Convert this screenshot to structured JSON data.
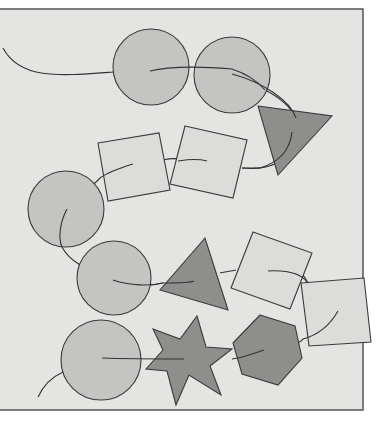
{
  "figure": {
    "colors": {
      "background": "#ffffff",
      "panel": "#e4e4e2",
      "circle_fill": "#c4c4c2",
      "square_fill": "#dcdcda",
      "dark_fill": "#8e8e8c",
      "stroke": "#3a3a3a"
    },
    "shapes": [
      {
        "type": "circle",
        "cx": 151,
        "cy": 67,
        "r": 38
      },
      {
        "type": "circle",
        "cx": 232,
        "cy": 75,
        "r": 38
      },
      {
        "type": "triangle",
        "points": "258,106 332,116 278,175"
      },
      {
        "type": "square",
        "points": "185,126 247,140 233,198 170,184"
      },
      {
        "type": "square",
        "points": "98,143 159,133 170,190 108,201"
      },
      {
        "type": "circle",
        "cx": 66,
        "cy": 209,
        "r": 38
      },
      {
        "type": "circle",
        "cx": 114,
        "cy": 278,
        "r": 37
      },
      {
        "type": "triangle",
        "points": "205,238 160,290 228,310"
      },
      {
        "type": "square",
        "points": "253,232 312,253 290,309 231,288"
      },
      {
        "type": "square",
        "points": "301,283 364,278 371,342 309,346"
      },
      {
        "type": "hexagon",
        "points": "260,315 295,326 302,358 278,385 242,374 233,343"
      },
      {
        "type": "star",
        "cx": 188,
        "cy": 358,
        "r_outer": 44,
        "r_inner": 24
      },
      {
        "type": "circle",
        "cx": 101,
        "cy": 360,
        "r": 40
      }
    ]
  }
}
